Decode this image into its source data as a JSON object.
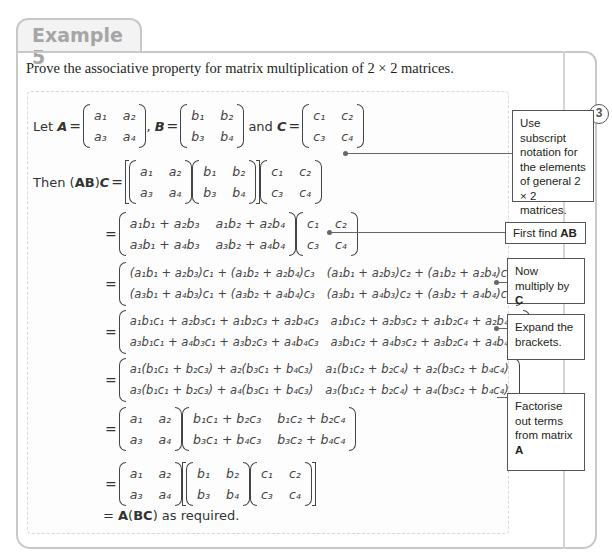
{
  "header": {
    "tab_label": "Example 5"
  },
  "intro": "Prove the associative property for matrix multiplication of 2 × 2 matrices.",
  "badge": "3",
  "proof": {
    "line1": {
      "prefix": "Let",
      "A": {
        "name": "A",
        "cells": [
          "a₁",
          "a₂",
          "a₃",
          "a₄"
        ]
      },
      "sep1": ",",
      "B": {
        "name": "B",
        "cells": [
          "b₁",
          "b₂",
          "b₃",
          "b₄"
        ]
      },
      "and": "and",
      "C": {
        "name": "C",
        "cells": [
          "c₁",
          "c₂",
          "c₃",
          "c₄"
        ]
      }
    },
    "line2": {
      "prefix": "Then",
      "lhs_open": "(",
      "lhs_AB": "AB",
      "lhs_close": ")",
      "lhs_C": "C"
    },
    "line3": {
      "cells": [
        "a₁b₁ + a₂b₃",
        "a₁b₂ + a₂b₄",
        "a₃b₁ + a₄b₃",
        "a₃b₂ + a₄b₄"
      ],
      "c_cells": [
        "c₁",
        "c₂",
        "c₃",
        "c₄"
      ]
    },
    "line4": {
      "cells": [
        "(a₁b₁ + a₂b₃)c₁ + (a₁b₂ + a₂b₄)c₃",
        "(a₁b₁ + a₂b₃)c₂ + (a₁b₂ + a₂b₄)c₄",
        "(a₃b₁ + a₄b₃)c₁ + (a₃b₂ + a₄b₄)c₃",
        "(a₃b₁ + a₄b₃)c₂ + (a₃b₂ + a₄b₄)c₄"
      ]
    },
    "line5": {
      "cells": [
        "a₁b₁c₁ + a₂b₃c₁ + a₁b₂c₃ + a₂b₄c₃",
        "a₁b₁c₂ + a₂b₃c₂ + a₁b₂c₄ + a₂b₄c₄",
        "a₃b₁c₁ + a₄b₃c₁ + a₃b₂c₃ + a₄b₄c₃",
        "a₃b₁c₂ + a₄b₃c₂ + a₃b₂c₄ + a₄b₄c₄"
      ]
    },
    "line6": {
      "cells": [
        "a₁(b₁c₁ + b₂c₃) + a₂(b₃c₁ + b₄c₃)",
        "a₁(b₁c₂ + b₂c₄) + a₂(b₃c₂ + b₄c₄)",
        "a₃(b₁c₁ + b₂c₃) + a₄(b₃c₁ + b₄c₃)",
        "a₃(b₁c₂ + b₂c₄) + a₄(b₃c₂ + b₄c₄)"
      ]
    },
    "line7": {
      "a_cells": [
        "a₁",
        "a₂",
        "a₃",
        "a₄"
      ],
      "cells": [
        "b₁c₁ + b₂c₃",
        "b₁c₂ + b₂c₄",
        "b₃c₁ + b₄c₃",
        "b₃c₂ + b₄c₄"
      ]
    },
    "line8": {
      "a_cells": [
        "a₁",
        "a₂",
        "a₃",
        "a₄"
      ],
      "b_cells": [
        "b₁",
        "b₂",
        "b₃",
        "b₄"
      ],
      "c_cells": [
        "c₁",
        "c₂",
        "c₃",
        "c₄"
      ]
    },
    "line9": {
      "eq": "=",
      "A": "A",
      "open": "(",
      "BC": "BC",
      "close": ")",
      "suffix": "as required."
    },
    "equals": "="
  },
  "notes": [
    {
      "text": "Use subscript notation for the elements of general 2 × 2 matrices."
    },
    {
      "text": "First find ",
      "bold": "AB"
    },
    {
      "text": "Now multiply by ",
      "bold": "C"
    },
    {
      "text": "Expand the brackets."
    },
    {
      "text": "Factorise out terms from matrix ",
      "bold": "A"
    }
  ]
}
